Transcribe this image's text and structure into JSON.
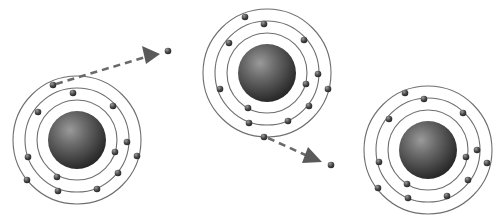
{
  "diagram": {
    "title": "",
    "description_label": "Electron ejected from one atom and captured by another",
    "colors": {
      "background": "#ffffff",
      "orbit": "#6e6e6e",
      "electron": "#3a3a3a",
      "nucleus_dark": "#262626",
      "nucleus_light": "#9a9a9a",
      "arrow": "#5a5a5a"
    },
    "atoms": [
      {
        "name": "atom-left",
        "cx": 77,
        "cy": 140,
        "nucleus_r": 29,
        "orbit_radii": [
          40,
          52,
          64
        ],
        "electrons": [
          [
            53,
            85
          ],
          [
            73,
            93
          ],
          [
            38,
            112
          ],
          [
            113,
            106
          ],
          [
            127,
            142
          ],
          [
            115,
            152
          ],
          [
            137,
            156
          ],
          [
            28,
            157
          ],
          [
            118,
            173
          ],
          [
            57,
            177
          ],
          [
            27,
            180
          ],
          [
            58,
            191
          ],
          [
            97,
            189
          ]
        ]
      },
      {
        "name": "atom-middle",
        "cx": 267,
        "cy": 73,
        "nucleus_r": 29,
        "orbit_radii": [
          40,
          52,
          64
        ],
        "electrons": [
          [
            245,
            17
          ],
          [
            264,
            24
          ],
          [
            229,
            43
          ],
          [
            304,
            40
          ],
          [
            318,
            74
          ],
          [
            306,
            84
          ],
          [
            328,
            89
          ],
          [
            220,
            89
          ],
          [
            309,
            106
          ],
          [
            248,
            108
          ],
          [
            249,
            123
          ],
          [
            288,
            121
          ],
          [
            264,
            137
          ]
        ]
      },
      {
        "name": "atom-right",
        "cx": 428,
        "cy": 150,
        "nucleus_r": 29,
        "orbit_radii": [
          40,
          52,
          64
        ],
        "electrons": [
          [
            405,
            93
          ],
          [
            424,
            99
          ],
          [
            389,
            119
          ],
          [
            463,
            113
          ],
          [
            477,
            150
          ],
          [
            466,
            157
          ],
          [
            487,
            163
          ],
          [
            379,
            162
          ],
          [
            468,
            180
          ],
          [
            407,
            184
          ],
          [
            378,
            188
          ],
          [
            408,
            198
          ],
          [
            447,
            196
          ]
        ]
      }
    ],
    "arrows": [
      {
        "name": "ejection-arrow",
        "from": [
          56,
          84
        ],
        "to": [
          152,
          55
        ],
        "head": [
          [
            142,
            46
          ],
          [
            160,
            54
          ],
          [
            146,
            64
          ]
        ],
        "free_electron": [
          168,
          51
        ]
      },
      {
        "name": "capture-arrow",
        "from": [
          268,
          138
        ],
        "to": [
          312,
          158
        ],
        "head": [
          [
            308,
            147
          ],
          [
            322,
            162
          ],
          [
            302,
            163
          ]
        ],
        "free_electron": [
          331,
          165
        ]
      }
    ]
  }
}
